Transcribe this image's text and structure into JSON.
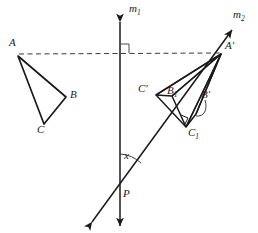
{
  "figure": {
    "background": "#ffffff",
    "stroke_color": "#1a1a1a",
    "width": 258,
    "height": 233
  },
  "lines": {
    "m1": {
      "label": "m",
      "subscript": "1",
      "label_x": 131,
      "label_y": 8,
      "x": 120,
      "y_top": 22,
      "y_bottom": 226,
      "style": "solid-double-arrow"
    },
    "m2": {
      "label": "m",
      "subscript": "2",
      "label_x": 235,
      "label_y": 14,
      "x1": 92,
      "y1": 222,
      "x2": 232,
      "y2": 30,
      "style": "solid-double-arrow"
    },
    "dashed_AA": {
      "x1": 19,
      "y1": 54,
      "x2": 220,
      "y2": 53,
      "style": "dashed",
      "name": "dashed-segment-A-to-Aprime"
    }
  },
  "marks": {
    "right_angle": {
      "x": 120,
      "y": 53,
      "size": 9,
      "name": "right-angle-mark"
    },
    "angle_x": {
      "label": "x",
      "label_x": 125,
      "label_y": 155,
      "arc_cx": 120,
      "arc_cy": 188,
      "arc_r": 34,
      "name": "angle-x-arc"
    },
    "small_square_C1": {
      "x": 186,
      "y": 118,
      "name": "small-right-angle-mark-near-c1"
    }
  },
  "triangles": [
    {
      "name": "triangle-ABC",
      "vertices": [
        {
          "label": "A",
          "prime": false,
          "sub": "",
          "x": 18,
          "y": 56,
          "label_x": 10,
          "label_y": 40
        },
        {
          "label": "B",
          "prime": false,
          "sub": "",
          "x": 66,
          "y": 97,
          "label_x": 70,
          "label_y": 93
        },
        {
          "label": "C",
          "prime": false,
          "sub": "",
          "x": 44,
          "y": 124,
          "label_x": 38,
          "label_y": 128
        }
      ]
    },
    {
      "name": "triangle-Aprime-Bprime-C1",
      "vertices": [
        {
          "label": "A",
          "prime": true,
          "sub": "",
          "x": 221,
          "y": 54,
          "label_x": 226,
          "label_y": 44
        },
        {
          "label": "B",
          "prime": true,
          "sub": "",
          "x": 196,
          "y": 114,
          "label_x": 203,
          "label_y": 93
        },
        {
          "label": "C",
          "prime": false,
          "sub": "1",
          "x": 186,
          "y": 127,
          "label_x": 189,
          "label_y": 129
        }
      ]
    },
    {
      "name": "triangle-Aprime-B1-Cprime",
      "vertices": [
        {
          "label": "A",
          "prime": true,
          "sub": "",
          "x": 221,
          "y": 54,
          "label_x": 226,
          "label_y": 44
        },
        {
          "label": "B",
          "prime": false,
          "sub": "1",
          "x": 172,
          "y": 96,
          "label_x": 167,
          "label_y": 89
        },
        {
          "label": "C",
          "prime": true,
          "sub": "",
          "x": 156,
          "y": 95,
          "label_x": 140,
          "label_y": 87
        }
      ]
    }
  ],
  "rays_from_Aprime": [
    {
      "name": "ray-Aprime-to-Cprime",
      "x1": 221,
      "y1": 54,
      "x2": 156,
      "y2": 95
    },
    {
      "name": "ray-Aprime-to-B1",
      "x1": 221,
      "y1": 54,
      "x2": 172,
      "y2": 96
    },
    {
      "name": "ray-Aprime-to-C1",
      "x1": 221,
      "y1": 54,
      "x2": 186,
      "y2": 127
    },
    {
      "name": "ray-Aprime-to-Bprime",
      "x1": 221,
      "y1": 54,
      "x2": 196,
      "y2": 114
    }
  ],
  "leader": {
    "name": "bprime-leader-curve",
    "path": "M 203 99 C 206 108, 203 115, 195 116"
  },
  "points": [
    {
      "label": "P",
      "x": 120,
      "y": 188,
      "label_x": 124,
      "label_y": 190,
      "name": "point-p"
    }
  ]
}
